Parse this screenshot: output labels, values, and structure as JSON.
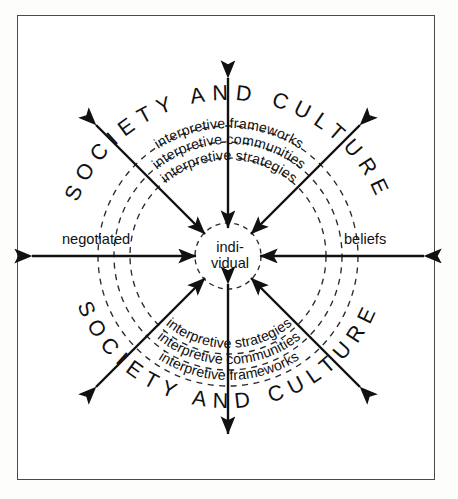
{
  "diagram": {
    "center": {
      "line1": "indi-",
      "line2": "vidual"
    },
    "outer_ring_label": "SOCIETY AND CULTURE",
    "rings": [
      {
        "id": "frameworks",
        "label": "interpretive frameworks"
      },
      {
        "id": "communities",
        "label": "interpretive communities"
      },
      {
        "id": "strategies",
        "label": "interpretive strategies"
      }
    ],
    "side_labels": {
      "left": "negotiated",
      "right": "beliefs"
    },
    "colors": {
      "stroke": "#111111",
      "dashed": "#2b2b2b",
      "frame": "#4a4a4a",
      "background": "#ffffff",
      "page": "#fdfdfc"
    },
    "axes": [
      {
        "id": "axis-vertical-up",
        "direction": "up",
        "arrowheads": "both"
      },
      {
        "id": "axis-vertical-down",
        "direction": "down",
        "arrowheads": "both"
      },
      {
        "id": "axis-diagonal-upleft",
        "direction": "up-left",
        "arrowheads": "both"
      },
      {
        "id": "axis-diagonal-upright",
        "direction": "up-right",
        "arrowheads": "both"
      },
      {
        "id": "axis-diagonal-downleft",
        "direction": "down-left",
        "arrowheads": "both"
      },
      {
        "id": "axis-diagonal-downright",
        "direction": "down-right",
        "arrowheads": "both"
      },
      {
        "id": "axis-horizontal-left",
        "direction": "left",
        "arrowheads": "both"
      },
      {
        "id": "axis-horizontal-right",
        "direction": "right",
        "arrowheads": "both"
      }
    ]
  }
}
